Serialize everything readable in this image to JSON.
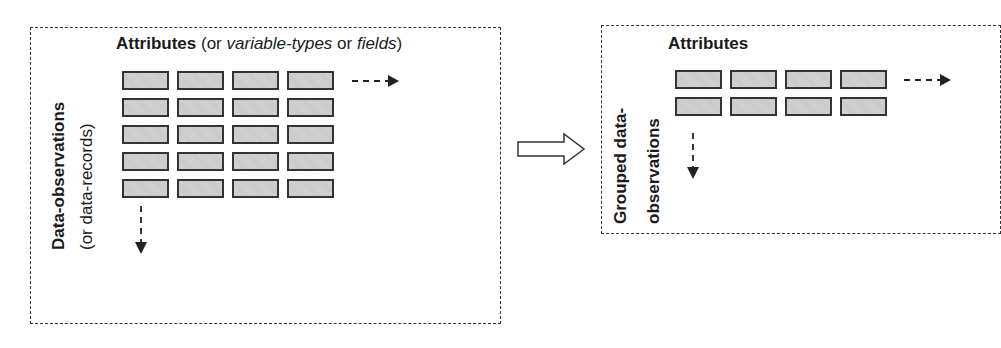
{
  "left_panel": {
    "title_bold": "Attributes",
    "title_open": " (or ",
    "title_italic1": "variable-types",
    "title_mid": " or ",
    "title_italic2": "fields",
    "title_close": ")",
    "row_label_bold": "Data-observations",
    "row_label_sub": "(or data-records)",
    "grid": {
      "rows": 5,
      "cols": 4
    }
  },
  "right_panel": {
    "title_bold": "Attributes",
    "row_label_line1": "Grouped data-",
    "row_label_line2": "observations",
    "grid": {
      "rows": 2,
      "cols": 4
    }
  },
  "transform_arrow": {
    "direction": "right",
    "style": "hollow"
  },
  "colors": {
    "cell_fill": "#c8c8c8",
    "cell_border": "#333333",
    "dash": "#333333"
  }
}
